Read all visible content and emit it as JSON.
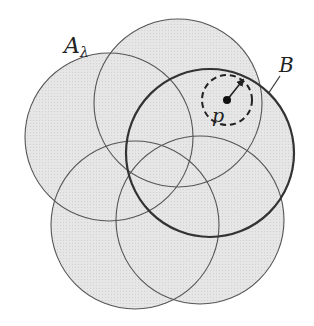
{
  "labels": {
    "A_main": "A",
    "A_sub": "λ",
    "B": "B",
    "p": "p"
  },
  "colors": {
    "fill": "#e4e4e4",
    "stroke": "#555555",
    "bold_stroke": "#333333",
    "background": "#ffffff"
  },
  "circles": [
    {
      "id": "A_lambda",
      "cx": 109,
      "cy": 137,
      "r": 84,
      "bold": false
    },
    {
      "id": "top",
      "cx": 178,
      "cy": 103,
      "r": 84,
      "bold": false
    },
    {
      "id": "lower_left",
      "cx": 135,
      "cy": 225,
      "r": 84,
      "bold": false
    },
    {
      "id": "lower_right",
      "cx": 200,
      "cy": 220,
      "r": 84,
      "bold": false
    },
    {
      "id": "B",
      "cx": 210,
      "cy": 153,
      "r": 84,
      "bold": true
    }
  ],
  "ball_around_p": {
    "cx": 227,
    "cy": 100,
    "r": 25,
    "dashed": true
  },
  "point_p": {
    "x": 227,
    "y": 100
  },
  "radius_arrow": {
    "x1": 227,
    "y1": 100,
    "x2": 243,
    "y2": 80
  }
}
